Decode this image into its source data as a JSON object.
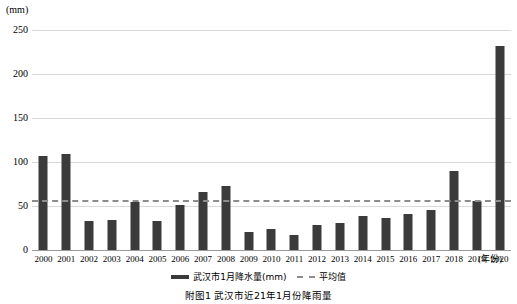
{
  "axis": {
    "unit_label": "(mm)",
    "x_axis_title": "(年份)",
    "y_ticks": [
      0,
      50,
      100,
      150,
      200,
      250
    ]
  },
  "legend": {
    "items": [
      {
        "icon": "bar-swatch",
        "label": "武汉市1月降水量(mm)"
      },
      {
        "icon": "dashed-line-swatch",
        "label": "平均值"
      }
    ]
  },
  "caption": "附图1  武汉市近21年1月份降雨量",
  "colors": {
    "bar": "#3b3b3b",
    "average_line": "#8d8d8d",
    "gridline": "#d9d9d9",
    "axis": "#9a9a9a"
  },
  "chart_data": {
    "type": "bar",
    "title": "武汉市近21年1月份降雨量",
    "xlabel": "(年份)",
    "ylabel": "(mm)",
    "ylim": [
      0,
      250
    ],
    "yticks": [
      0,
      50,
      100,
      150,
      200,
      250
    ],
    "grid": true,
    "legend_position": "bottom",
    "categories": [
      "2000",
      "2001",
      "2002",
      "2003",
      "2004",
      "2005",
      "2006",
      "2007",
      "2008",
      "2009",
      "2010",
      "2011",
      "2012",
      "2013",
      "2014",
      "2015",
      "2016",
      "2017",
      "2018",
      "2019",
      "2020"
    ],
    "series": [
      {
        "name": "武汉市1月降水量(mm)",
        "type": "bar",
        "values": [
          107,
          109,
          33,
          34,
          55,
          33,
          51,
          66,
          73,
          21,
          24,
          17,
          28,
          31,
          39,
          36,
          41,
          45,
          90,
          56,
          232
        ]
      },
      {
        "name": "平均值",
        "type": "line",
        "style": "dashed",
        "constant_value": 57
      }
    ]
  }
}
